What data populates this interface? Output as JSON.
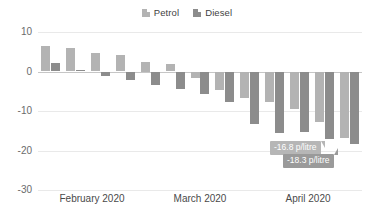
{
  "legend": {
    "position": "top-center",
    "items": [
      {
        "label": "Petrol",
        "color": "#b3b3b3",
        "icon": "legend-swatch-icon"
      },
      {
        "label": "Diesel",
        "color": "#8c8c8c",
        "icon": "legend-swatch-icon"
      }
    ]
  },
  "axis": {
    "y_ticks": [
      "10",
      "0",
      "-10",
      "-20",
      "-30"
    ],
    "x_ticks": [
      "February 2020",
      "March 2020",
      "April 2020"
    ]
  },
  "callouts": [
    {
      "name": "petrol-callout",
      "text": "-16.8 p/litre",
      "color": "#b6b6b6"
    },
    {
      "name": "diesel-callout",
      "text": "-18.3 p/litre",
      "color": "#9a9a9a"
    }
  ],
  "chart_data": {
    "type": "bar",
    "title": "",
    "subtitle": "",
    "xlabel": "",
    "ylabel": "",
    "ylim": [
      -30,
      10
    ],
    "y_ticks": [
      10,
      0,
      -10,
      -20,
      -30
    ],
    "grid": true,
    "legend_position": "top-center",
    "categories": [
      "w1",
      "w2",
      "w3",
      "w4",
      "w5",
      "w6",
      "w7",
      "w8",
      "w9",
      "w10",
      "w11",
      "w12",
      "w13"
    ],
    "x_group_labels": [
      "February 2020",
      "March 2020",
      "April 2020"
    ],
    "series": [
      {
        "name": "Petrol",
        "color": "#b3b3b3",
        "values": [
          6.5,
          5.9,
          4.8,
          4.2,
          2.5,
          1.9,
          -1.6,
          -4.6,
          -6.7,
          -7.8,
          -9.5,
          -12.8,
          -16.8
        ]
      },
      {
        "name": "Diesel",
        "color": "#8c8c8c",
        "values": [
          2.2,
          0.4,
          -1.2,
          -2.2,
          -3.5,
          -4.5,
          -5.6,
          -7.7,
          -13.2,
          -15.6,
          -15.4,
          -17.2,
          -18.3
        ]
      }
    ],
    "annotations": [
      {
        "series": "Petrol",
        "category": "w13",
        "text": "-16.8 p/litre",
        "value": -16.8
      },
      {
        "series": "Diesel",
        "category": "w13",
        "text": "-18.3 p/litre",
        "value": -18.3
      }
    ],
    "units": "p/litre"
  }
}
